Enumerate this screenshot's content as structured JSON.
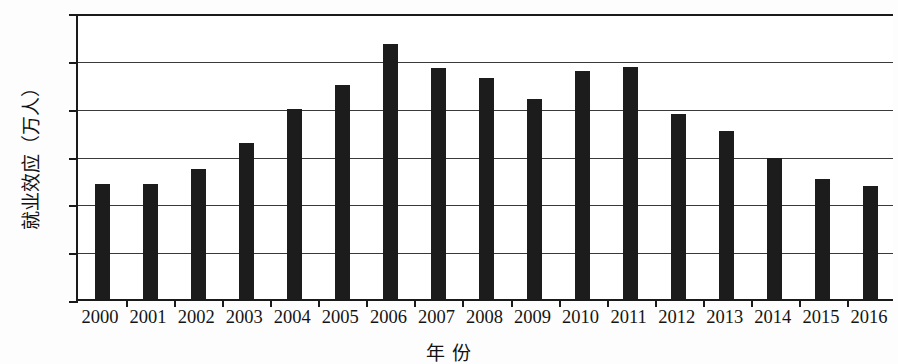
{
  "chart_data": {
    "type": "bar",
    "title": "",
    "xlabel": "年 份",
    "ylabel": "就业效应（万人）",
    "categories": [
      "2000",
      "2001",
      "2002",
      "2003",
      "2004",
      "2005",
      "2006",
      "2007",
      "2008",
      "2009",
      "2010",
      "2011",
      "2012",
      "2013",
      "2014",
      "2015",
      "2016"
    ],
    "values": [
      120,
      120,
      136,
      163,
      199,
      224,
      267,
      241,
      231,
      209,
      238,
      243,
      193,
      176,
      147,
      125,
      118
    ],
    "ylim": [
      0,
      300
    ],
    "ytick_labels": [
      "300",
      "250",
      "200",
      "150",
      "100",
      "50",
      "0"
    ],
    "ytick_values": [
      300,
      250,
      200,
      150,
      100,
      50,
      0
    ],
    "grid": true,
    "legend": false,
    "bar_color": "#1c1c1c",
    "axis_color": "#1a1a1a",
    "grid_color": "#3a3a3a"
  }
}
